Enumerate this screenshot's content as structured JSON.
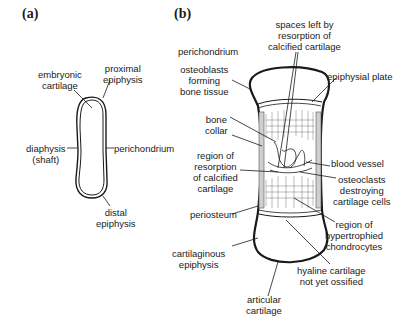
{
  "panels": {
    "a": {
      "label": "(a)",
      "annotations": {
        "embryonic_cartilage": [
          "embryonic",
          "cartilage"
        ],
        "proximal_epiphysis": [
          "proximal",
          "epiphysis"
        ],
        "diaphysis": [
          "diaphysis",
          "(shaft)"
        ],
        "perichondrium": [
          "perichondrium"
        ],
        "distal_epiphysis": [
          "distal",
          "epiphysis"
        ]
      }
    },
    "b": {
      "label": "(b)",
      "annotations": {
        "spaces_left": [
          "spaces left by",
          "resorption of",
          "calcified cartilage"
        ],
        "perichondrium": [
          "perichondrium"
        ],
        "osteoblasts": [
          "osteoblasts",
          "forming",
          "bone tissue"
        ],
        "epiphysial_plate": [
          "epiphysial plate"
        ],
        "bone_collar": [
          "bone",
          "collar"
        ],
        "blood_vessel": [
          "blood vessel"
        ],
        "region_resorption": [
          "region of",
          "resorption",
          "of calcified",
          "cartilage"
        ],
        "osteoclasts": [
          "osteoclasts",
          "destroying",
          "cartilage cells"
        ],
        "periosteum": [
          "periosteum"
        ],
        "hypertrophied": [
          "region of",
          "hypertrophied",
          "chondrocytes"
        ],
        "cartilaginous_epiphysis": [
          "cartilaginous",
          "epiphysis"
        ],
        "hyaline": [
          "hyaline cartilage",
          "not yet ossified"
        ],
        "articular": [
          "articular",
          "cartilage"
        ]
      }
    }
  }
}
